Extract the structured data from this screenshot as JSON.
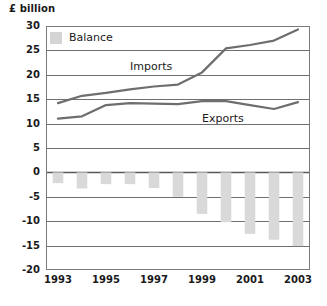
{
  "chart_data": {
    "type": "bar",
    "title": "",
    "subtitle": "",
    "unit_label": "£ billion",
    "xlabel": "",
    "ylabel": "£ billion",
    "ylim": [
      -20,
      30
    ],
    "ytick_labels": [
      "30",
      "25",
      "20",
      "15",
      "10",
      "5",
      "0",
      "-5",
      "-10",
      "-15",
      "-20"
    ],
    "ytick_values": [
      30,
      25,
      20,
      15,
      10,
      5,
      0,
      -5,
      -10,
      -15,
      -20
    ],
    "grid": true,
    "legend_position": "top-left",
    "legend": [
      "Balance"
    ],
    "categories": [
      "1993",
      "1994",
      "1995",
      "1996",
      "1997",
      "1998",
      "1999",
      "2000",
      "2001",
      "2002",
      "2003"
    ],
    "xtick_labels": [
      "1993",
      "1995",
      "1997",
      "1999",
      "2001",
      "2003"
    ],
    "xtick_values": [
      1993,
      1995,
      1997,
      1999,
      2001,
      2003
    ],
    "series": [
      {
        "name": "Balance",
        "type": "bar",
        "color": "#d9d9d9",
        "values": [
          -2.2,
          -3.3,
          -2.4,
          -2.4,
          -3.2,
          -5.0,
          -8.5,
          -10.2,
          -12.6,
          -13.8,
          -15.1
        ]
      },
      {
        "name": "Imports",
        "type": "line",
        "color": "#6e6e6e",
        "values": [
          14.2,
          15.7,
          16.3,
          17.0,
          17.6,
          18.0,
          20.5,
          25.4,
          26.1,
          27.0,
          29.3
        ]
      },
      {
        "name": "Exports",
        "type": "line",
        "color": "#6e6e6e",
        "values": [
          11.0,
          11.5,
          13.8,
          14.2,
          14.1,
          14.0,
          14.6,
          14.6,
          13.8,
          13.0,
          14.4
        ]
      }
    ],
    "annotations": [
      {
        "text": "Imports",
        "x": 1997,
        "y": 21.5
      },
      {
        "text": "Exports",
        "x": 2000,
        "y": 11.0
      }
    ]
  }
}
